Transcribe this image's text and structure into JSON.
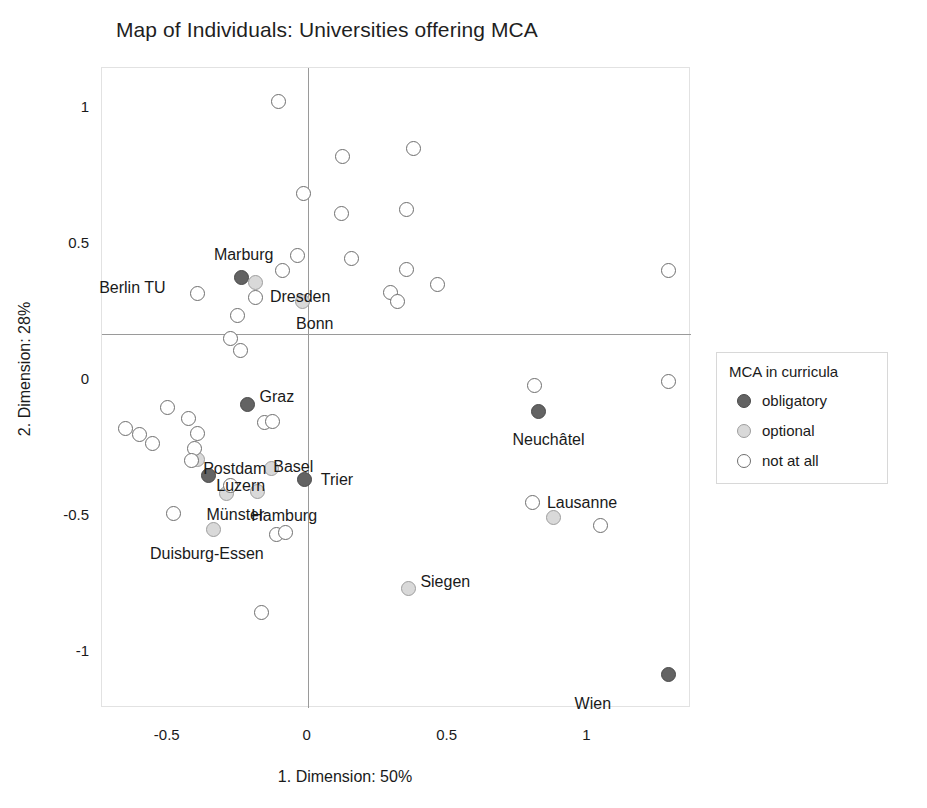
{
  "chart_data": {
    "type": "scatter",
    "title": "Map of Individuals: Universities offering MCA",
    "xlabel": "1. Dimension: 50%",
    "ylabel": "2. Dimension: 28%",
    "xlim": [
      -0.735,
      1.37
    ],
    "ylim": [
      -1.21,
      1.145
    ],
    "xticks": [
      -0.5,
      0,
      0.5,
      1
    ],
    "xticklabels": [
      "-0.5",
      "0",
      "0.5",
      "1"
    ],
    "yticks": [
      1,
      0.5,
      0,
      -0.5,
      -1
    ],
    "yticklabels": [
      "1",
      "0.5",
      "0",
      "-0.5",
      "-1"
    ],
    "grid": false,
    "zero_lines": true,
    "legend": {
      "title": "MCA in curricula",
      "position": "right",
      "entries": [
        {
          "label": "obligatory",
          "group": "obligatory",
          "color": "#636363"
        },
        {
          "label": "optional",
          "group": "optional",
          "color": "#d9d9d9"
        },
        {
          "label": "not at all",
          "group": "none",
          "color": "#ffffff"
        }
      ]
    },
    "points": [
      {
        "label": "Marburg",
        "x": -0.235,
        "y": 0.375,
        "group": "obligatory",
        "label_dx": -28,
        "label_dy": -22
      },
      {
        "label": "Berlin TU",
        "x": -0.395,
        "y": 0.315,
        "group": "none",
        "label_dx": -98,
        "label_dy": -6
      },
      {
        "label": "Dresden",
        "x": -0.185,
        "y": 0.355,
        "group": "optional",
        "label_dx": 14,
        "label_dy": 14
      },
      {
        "label": "Bonn",
        "x": -0.02,
        "y": 0.285,
        "group": "optional",
        "label_dx": -6,
        "label_dy": 22
      },
      {
        "label": "Graz",
        "x": -0.215,
        "y": -0.095,
        "group": "obligatory",
        "label_dx": 12,
        "label_dy": -8
      },
      {
        "label": "Postdam",
        "x": -0.395,
        "y": -0.295,
        "group": "optional",
        "label_dx": 6,
        "label_dy": 10
      },
      {
        "label": "Basel",
        "x": -0.13,
        "y": -0.33,
        "group": "optional",
        "label_dx": 2,
        "label_dy": -2
      },
      {
        "label": "Luzern",
        "x": -0.355,
        "y": -0.355,
        "group": "obligatory",
        "label_dx": 8,
        "label_dy": 10
      },
      {
        "label": "Trier",
        "x": -0.01,
        "y": -0.37,
        "group": "obligatory",
        "label_dx": 16,
        "label_dy": 0
      },
      {
        "label": "Münster",
        "x": -0.29,
        "y": -0.42,
        "group": "optional",
        "label_dx": -20,
        "label_dy": 22
      },
      {
        "label": "Hamburg",
        "x": -0.18,
        "y": -0.415,
        "group": "optional",
        "label_dx": -6,
        "label_dy": 24
      },
      {
        "label": "Duisburg-Essen",
        "x": -0.335,
        "y": -0.555,
        "group": "optional",
        "label_dx": -64,
        "label_dy": 24
      },
      {
        "label": "Neuchâtel",
        "x": 0.825,
        "y": -0.12,
        "group": "obligatory",
        "label_dx": -26,
        "label_dy": 28
      },
      {
        "label": "Lausanne",
        "x": 0.805,
        "y": -0.455,
        "group": "none",
        "label_dx": 14,
        "label_dy": 0
      },
      {
        "label": "Siegen",
        "x": 0.36,
        "y": -0.77,
        "group": "optional",
        "label_dx": 12,
        "label_dy": -6
      },
      {
        "label": "Wien",
        "x": 1.29,
        "y": -1.085,
        "group": "obligatory",
        "label_dx": -94,
        "label_dy": 30
      },
      {
        "label": "",
        "x": -0.105,
        "y": 1.02,
        "group": "none"
      },
      {
        "label": "",
        "x": 0.125,
        "y": 0.82,
        "group": "none"
      },
      {
        "label": "",
        "x": 0.38,
        "y": 0.85,
        "group": "none"
      },
      {
        "label": "",
        "x": -0.015,
        "y": 0.685,
        "group": "none"
      },
      {
        "label": "",
        "x": 0.12,
        "y": 0.61,
        "group": "none"
      },
      {
        "label": "",
        "x": 0.355,
        "y": 0.625,
        "group": "none"
      },
      {
        "label": "",
        "x": -0.035,
        "y": 0.455,
        "group": "none"
      },
      {
        "label": "",
        "x": -0.09,
        "y": 0.4,
        "group": "none"
      },
      {
        "label": "",
        "x": 0.155,
        "y": 0.445,
        "group": "none"
      },
      {
        "label": "",
        "x": 0.355,
        "y": 0.405,
        "group": "none"
      },
      {
        "label": "",
        "x": 1.29,
        "y": 0.4,
        "group": "none"
      },
      {
        "label": "",
        "x": 0.295,
        "y": 0.32,
        "group": "none"
      },
      {
        "label": "",
        "x": 0.32,
        "y": 0.285,
        "group": "none"
      },
      {
        "label": "",
        "x": 0.465,
        "y": 0.35,
        "group": "none"
      },
      {
        "label": "",
        "x": -0.185,
        "y": 0.3,
        "group": "none"
      },
      {
        "label": "",
        "x": -0.25,
        "y": 0.235,
        "group": "none"
      },
      {
        "label": "",
        "x": -0.275,
        "y": 0.15,
        "group": "none"
      },
      {
        "label": "",
        "x": -0.24,
        "y": 0.105,
        "group": "none"
      },
      {
        "label": "",
        "x": 0.81,
        "y": -0.025,
        "group": "none"
      },
      {
        "label": "",
        "x": 1.29,
        "y": -0.01,
        "group": "none"
      },
      {
        "label": "",
        "x": -0.155,
        "y": -0.16,
        "group": "none"
      },
      {
        "label": "",
        "x": -0.125,
        "y": -0.155,
        "group": "none"
      },
      {
        "label": "",
        "x": -0.5,
        "y": -0.105,
        "group": "none"
      },
      {
        "label": "",
        "x": -0.65,
        "y": -0.18,
        "group": "none"
      },
      {
        "label": "",
        "x": -0.425,
        "y": -0.145,
        "group": "none"
      },
      {
        "label": "",
        "x": -0.6,
        "y": -0.205,
        "group": "none"
      },
      {
        "label": "",
        "x": -0.395,
        "y": -0.2,
        "group": "none"
      },
      {
        "label": "",
        "x": -0.555,
        "y": -0.235,
        "group": "none"
      },
      {
        "label": "",
        "x": -0.405,
        "y": -0.255,
        "group": "none"
      },
      {
        "label": "",
        "x": -0.415,
        "y": -0.3,
        "group": "none"
      },
      {
        "label": "",
        "x": -0.275,
        "y": -0.39,
        "group": "none"
      },
      {
        "label": "",
        "x": -0.48,
        "y": -0.495,
        "group": "none"
      },
      {
        "label": "",
        "x": -0.11,
        "y": -0.57,
        "group": "none"
      },
      {
        "label": "",
        "x": -0.08,
        "y": -0.565,
        "group": "none"
      },
      {
        "label": "",
        "x": -0.165,
        "y": -0.86,
        "group": "none"
      },
      {
        "label": "",
        "x": 0.88,
        "y": -0.51,
        "group": "optional"
      },
      {
        "label": "",
        "x": 1.045,
        "y": -0.54,
        "group": "none"
      }
    ]
  },
  "caption": ""
}
